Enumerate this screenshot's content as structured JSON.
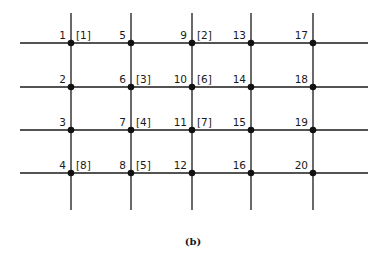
{
  "figure": {
    "caption": "(b)",
    "grid": {
      "columns": 5,
      "rows": 4,
      "node_numbering": "column-major, top to bottom"
    },
    "nodes": [
      {
        "id": "1",
        "col": 0,
        "row": 0
      },
      {
        "id": "2",
        "col": 0,
        "row": 1
      },
      {
        "id": "3",
        "col": 0,
        "row": 2
      },
      {
        "id": "4",
        "col": 0,
        "row": 3
      },
      {
        "id": "5",
        "col": 1,
        "row": 0
      },
      {
        "id": "6",
        "col": 1,
        "row": 1
      },
      {
        "id": "7",
        "col": 1,
        "row": 2
      },
      {
        "id": "8",
        "col": 1,
        "row": 3
      },
      {
        "id": "9",
        "col": 2,
        "row": 0
      },
      {
        "id": "10",
        "col": 2,
        "row": 1
      },
      {
        "id": "11",
        "col": 2,
        "row": 2
      },
      {
        "id": "12",
        "col": 2,
        "row": 3
      },
      {
        "id": "13",
        "col": 3,
        "row": 0
      },
      {
        "id": "14",
        "col": 3,
        "row": 1
      },
      {
        "id": "15",
        "col": 3,
        "row": 2
      },
      {
        "id": "16",
        "col": 3,
        "row": 3
      },
      {
        "id": "17",
        "col": 4,
        "row": 0
      },
      {
        "id": "18",
        "col": 4,
        "row": 1
      },
      {
        "id": "19",
        "col": 4,
        "row": 2
      },
      {
        "id": "20",
        "col": 4,
        "row": 3
      }
    ],
    "bracket_labels": [
      {
        "text": "[1]",
        "col": 0,
        "row": 0
      },
      {
        "text": "[2]",
        "col": 2,
        "row": 0
      },
      {
        "text": "[3]",
        "col": 1,
        "row": 1
      },
      {
        "text": "[6]",
        "col": 2,
        "row": 1
      },
      {
        "text": "[4]",
        "col": 1,
        "row": 2
      },
      {
        "text": "[7]",
        "col": 2,
        "row": 2
      },
      {
        "text": "[8]",
        "col": 0,
        "row": 3
      },
      {
        "text": "[5]",
        "col": 1,
        "row": 3
      }
    ]
  }
}
